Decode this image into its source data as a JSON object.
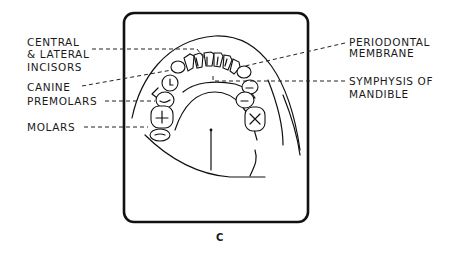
{
  "figure": {
    "caption": "C"
  },
  "labels_left": [
    {
      "id": "incisors",
      "lines": [
        "CENTRAL",
        "& LATERAL",
        "INCISORS"
      ]
    },
    {
      "id": "canine",
      "lines": [
        "CANINE"
      ]
    },
    {
      "id": "premolars",
      "lines": [
        "PREMOLARS"
      ]
    },
    {
      "id": "molars",
      "lines": [
        "MOLARS"
      ]
    }
  ],
  "labels_right": [
    {
      "id": "periodontal",
      "lines": [
        "PERIODONTAL",
        "MEMBRANE"
      ]
    },
    {
      "id": "symphysis",
      "lines": [
        "SYMPHYSIS OF",
        "MANDIBLE"
      ]
    }
  ]
}
